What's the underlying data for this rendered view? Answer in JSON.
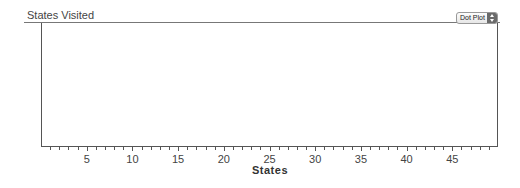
{
  "header": {
    "title": "States Visited",
    "plot_type_select": {
      "selected": "Dot Plot"
    }
  },
  "chart_data": {
    "type": "scatter",
    "subtype": "dot plot",
    "title": "States Visited",
    "xlabel": "States",
    "ylabel": "",
    "xlim": [
      0,
      50
    ],
    "x_ticks": [
      5,
      10,
      15,
      20,
      25,
      30,
      35,
      40,
      45
    ],
    "x_tick_labels": [
      "5",
      "10",
      "15",
      "20",
      "25",
      "30",
      "35",
      "40",
      "45"
    ],
    "minor_tick_step": 1,
    "values": [],
    "grid": false,
    "legend": null
  }
}
